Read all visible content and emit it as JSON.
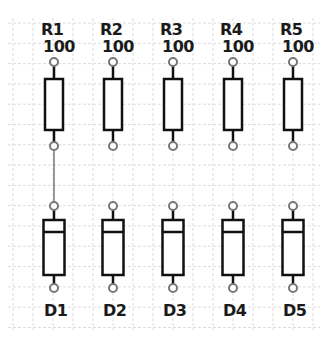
{
  "colors": {
    "background": "#ffffff",
    "grid": "#dcdcdc",
    "component_outline": "#111111",
    "pin": "#777777",
    "wire": "#777777",
    "label": "#1a1a1a"
  },
  "resistors": [
    {
      "ref": "R1",
      "value": "100",
      "x": 54
    },
    {
      "ref": "R2",
      "value": "100",
      "x": 113
    },
    {
      "ref": "R3",
      "value": "100",
      "x": 173
    },
    {
      "ref": "R4",
      "value": "100",
      "x": 233
    },
    {
      "ref": "R5",
      "value": "100",
      "x": 293
    }
  ],
  "diodes": [
    {
      "ref": "D1",
      "x": 54
    },
    {
      "ref": "D2",
      "x": 113
    },
    {
      "ref": "D3",
      "x": 173
    },
    {
      "ref": "D4",
      "x": 233
    },
    {
      "ref": "D5",
      "x": 293
    }
  ],
  "wires": [
    {
      "from": "R1.pin2",
      "to": "D1.pin1"
    }
  ]
}
